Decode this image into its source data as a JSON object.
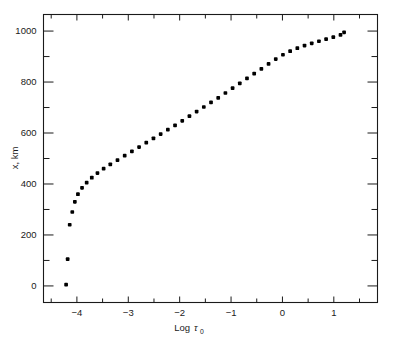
{
  "figure": {
    "background_color": "#ffffff",
    "marker_color": "#000000",
    "axis_color": "#1a1a1a"
  },
  "chart_data": {
    "type": "scatter",
    "title": "",
    "subtitle": "",
    "xlabel": "Log τ₀",
    "xlabel_main": "Log",
    "xlabel_symbol": "τ",
    "xlabel_subscript": "0",
    "ylabel": "x, km",
    "xlim": [
      -4.65,
      1.85
    ],
    "ylim": [
      -65,
      1065
    ],
    "xticks": [
      -4,
      -3,
      -2,
      -1,
      0,
      1
    ],
    "xtick_labels": [
      "−4",
      "−3",
      "−2",
      "−1",
      "0",
      "1"
    ],
    "yticks": [
      0,
      200,
      400,
      600,
      800,
      1000
    ],
    "ytick_labels": [
      "0",
      "200",
      "400",
      "600",
      "800",
      "1000"
    ],
    "y_minor_ticks": [
      100,
      300,
      500,
      700,
      900
    ],
    "x_minor_ticks": [
      -4.5,
      -3.5,
      -2.5,
      -1.5,
      -0.5,
      0.5,
      1.5
    ],
    "grid": false,
    "legend": null,
    "marker_size_px": 2.6,
    "series": [
      {
        "name": "x vs Log tau_0",
        "x": [
          -4.21,
          -4.18,
          -4.14,
          -4.09,
          -4.04,
          -3.98,
          -3.9,
          -3.81,
          -3.71,
          -3.6,
          -3.48,
          -3.35,
          -3.21,
          -3.07,
          -2.93,
          -2.79,
          -2.65,
          -2.51,
          -2.37,
          -2.23,
          -2.09,
          -1.95,
          -1.81,
          -1.67,
          -1.53,
          -1.39,
          -1.25,
          -1.11,
          -0.97,
          -0.83,
          -0.69,
          -0.55,
          -0.41,
          -0.27,
          -0.13,
          0.01,
          0.15,
          0.29,
          0.43,
          0.57,
          0.71,
          0.85,
          0.99,
          1.13,
          1.2
        ],
        "y": [
          5,
          105,
          240,
          290,
          330,
          360,
          385,
          405,
          425,
          443,
          460,
          477,
          494,
          511,
          528,
          545,
          562,
          579,
          596,
          613,
          630,
          648,
          666,
          684,
          702,
          720,
          738,
          757,
          776,
          795,
          814,
          833,
          852,
          871,
          890,
          907,
          921,
          933,
          943,
          952,
          960,
          968,
          976,
          985,
          995
        ]
      }
    ]
  }
}
